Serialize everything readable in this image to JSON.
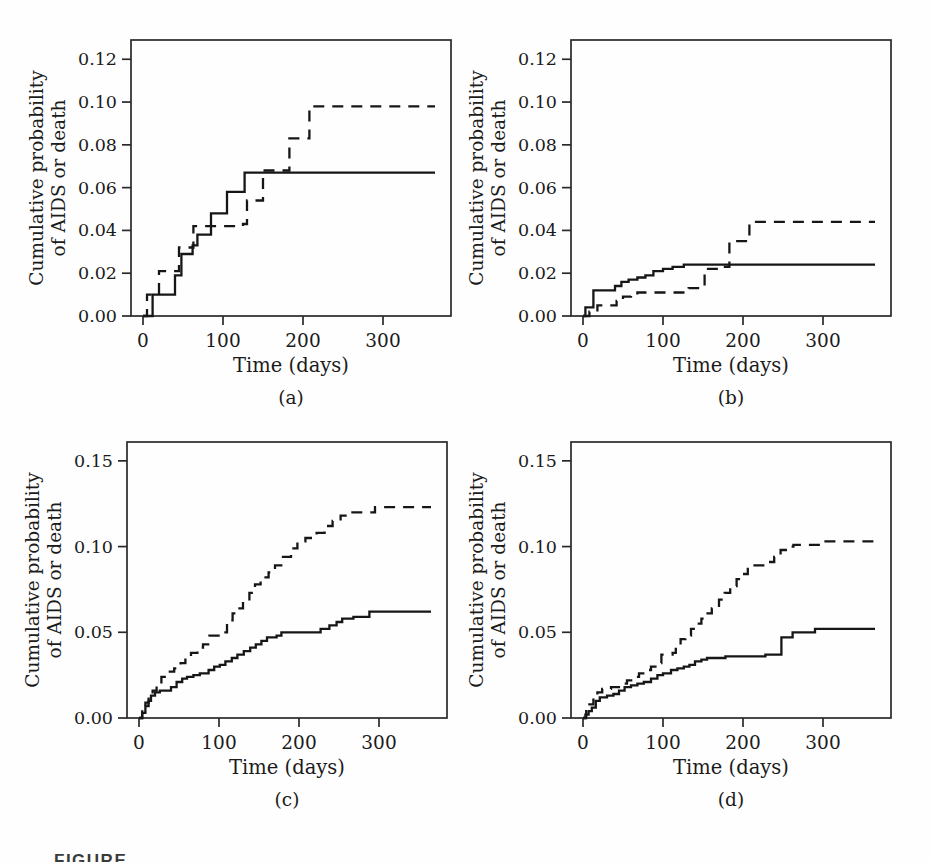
{
  "figure": {
    "bottom_caption_partial": "FIGURE"
  },
  "chart_data": [
    {
      "id": "a",
      "caption": "(a)",
      "type": "line",
      "subtype": "step",
      "xlabel": "Time (days)",
      "ylabel_lines": [
        "Cumulative probability",
        "of AIDS or death"
      ],
      "xlim": [
        -15,
        385
      ],
      "ylim": [
        0,
        0.129
      ],
      "xticks": [
        0,
        100,
        200,
        300
      ],
      "xtick_labels": [
        "0",
        "100",
        "200",
        "300"
      ],
      "yticks": [
        0,
        0.02,
        0.04,
        0.06,
        0.08,
        0.1,
        0.12
      ],
      "ytick_labels": [
        "0.00",
        "0.02",
        "0.04",
        "0.06",
        "0.08",
        "0.10",
        "0.12"
      ],
      "grid": false,
      "legend": "none",
      "line_color": "#161616",
      "series": [
        {
          "name": "solid",
          "dash": "solid",
          "points": [
            [
              0,
              0
            ],
            [
              12,
              0.01
            ],
            [
              40,
              0.019
            ],
            [
              48,
              0.029
            ],
            [
              62,
              0.033
            ],
            [
              68,
              0.038
            ],
            [
              85,
              0.048
            ],
            [
              105,
              0.058
            ],
            [
              127,
              0.067
            ],
            [
              365,
              0.067
            ]
          ]
        },
        {
          "name": "dashed",
          "dash": "dashed",
          "points": [
            [
              0,
              0
            ],
            [
              5,
              0.01
            ],
            [
              20,
              0.021
            ],
            [
              45,
              0.032
            ],
            [
              63,
              0.042
            ],
            [
              125,
              0.043
            ],
            [
              130,
              0.054
            ],
            [
              150,
              0.068
            ],
            [
              183,
              0.083
            ],
            [
              208,
              0.098
            ],
            [
              365,
              0.098
            ]
          ]
        }
      ]
    },
    {
      "id": "b",
      "caption": "(b)",
      "type": "line",
      "subtype": "step",
      "xlabel": "Time (days)",
      "ylabel_lines": [
        "Cumulative probability",
        "of AIDS or death"
      ],
      "xlim": [
        -15,
        385
      ],
      "ylim": [
        0,
        0.129
      ],
      "xticks": [
        0,
        100,
        200,
        300
      ],
      "xtick_labels": [
        "0",
        "100",
        "200",
        "300"
      ],
      "yticks": [
        0,
        0.02,
        0.04,
        0.06,
        0.08,
        0.1,
        0.12
      ],
      "ytick_labels": [
        "0.00",
        "0.02",
        "0.04",
        "0.06",
        "0.08",
        "0.10",
        "0.12"
      ],
      "grid": false,
      "legend": "none",
      "line_color": "#161616",
      "series": [
        {
          "name": "solid",
          "dash": "solid",
          "points": [
            [
              0,
              0
            ],
            [
              3,
              0.004
            ],
            [
              13,
              0.012
            ],
            [
              40,
              0.014
            ],
            [
              48,
              0.016
            ],
            [
              57,
              0.017
            ],
            [
              68,
              0.018
            ],
            [
              78,
              0.019
            ],
            [
              88,
              0.021
            ],
            [
              100,
              0.022
            ],
            [
              112,
              0.023
            ],
            [
              126,
              0.024
            ],
            [
              365,
              0.024
            ]
          ]
        },
        {
          "name": "dashed",
          "dash": "dashed",
          "points": [
            [
              0,
              0
            ],
            [
              8,
              0.002
            ],
            [
              18,
              0.005
            ],
            [
              42,
              0.007
            ],
            [
              50,
              0.009
            ],
            [
              60,
              0.01
            ],
            [
              68,
              0.011
            ],
            [
              132,
              0.013
            ],
            [
              152,
              0.022
            ],
            [
              176,
              0.023
            ],
            [
              183,
              0.035
            ],
            [
              208,
              0.044
            ],
            [
              365,
              0.044
            ]
          ]
        }
      ]
    },
    {
      "id": "c",
      "caption": "(c)",
      "type": "line",
      "subtype": "step",
      "xlabel": "Time (days)",
      "ylabel_lines": [
        "Cumulative probability",
        "of AIDS or death"
      ],
      "xlim": [
        -15,
        385
      ],
      "ylim": [
        0,
        0.161
      ],
      "xticks": [
        0,
        100,
        200,
        300
      ],
      "xtick_labels": [
        "0",
        "100",
        "200",
        "300"
      ],
      "yticks": [
        0,
        0.05,
        0.1,
        0.15
      ],
      "ytick_labels": [
        "0.00",
        "0.05",
        "0.10",
        "0.15"
      ],
      "grid": false,
      "legend": "none",
      "line_color": "#161616",
      "series": [
        {
          "name": "solid",
          "dash": "solid",
          "points": [
            [
              0,
              0
            ],
            [
              4,
              0.003
            ],
            [
              8,
              0.007
            ],
            [
              12,
              0.01
            ],
            [
              15,
              0.013
            ],
            [
              20,
              0.015
            ],
            [
              26,
              0.016
            ],
            [
              40,
              0.018
            ],
            [
              47,
              0.021
            ],
            [
              54,
              0.023
            ],
            [
              60,
              0.024
            ],
            [
              68,
              0.025
            ],
            [
              76,
              0.026
            ],
            [
              87,
              0.028
            ],
            [
              94,
              0.03
            ],
            [
              101,
              0.031
            ],
            [
              108,
              0.033
            ],
            [
              116,
              0.035
            ],
            [
              123,
              0.037
            ],
            [
              131,
              0.039
            ],
            [
              139,
              0.041
            ],
            [
              146,
              0.043
            ],
            [
              153,
              0.045
            ],
            [
              160,
              0.047
            ],
            [
              172,
              0.048
            ],
            [
              178,
              0.05
            ],
            [
              227,
              0.052
            ],
            [
              238,
              0.054
            ],
            [
              247,
              0.056
            ],
            [
              254,
              0.058
            ],
            [
              268,
              0.059
            ],
            [
              288,
              0.062
            ],
            [
              365,
              0.062
            ]
          ]
        },
        {
          "name": "dashed",
          "dash": "dashed",
          "points": [
            [
              0,
              0
            ],
            [
              4,
              0.005
            ],
            [
              8,
              0.009
            ],
            [
              12,
              0.013
            ],
            [
              17,
              0.016
            ],
            [
              22,
              0.02
            ],
            [
              28,
              0.024
            ],
            [
              34,
              0.027
            ],
            [
              44,
              0.029
            ],
            [
              52,
              0.032
            ],
            [
              58,
              0.035
            ],
            [
              65,
              0.038
            ],
            [
              73,
              0.041
            ],
            [
              80,
              0.043
            ],
            [
              88,
              0.048
            ],
            [
              105,
              0.05
            ],
            [
              110,
              0.057
            ],
            [
              117,
              0.061
            ],
            [
              124,
              0.064
            ],
            [
              130,
              0.068
            ],
            [
              138,
              0.073
            ],
            [
              145,
              0.078
            ],
            [
              152,
              0.082
            ],
            [
              162,
              0.085
            ],
            [
              170,
              0.089
            ],
            [
              180,
              0.094
            ],
            [
              190,
              0.099
            ],
            [
              198,
              0.103
            ],
            [
              208,
              0.105
            ],
            [
              222,
              0.108
            ],
            [
              232,
              0.112
            ],
            [
              242,
              0.115
            ],
            [
              252,
              0.118
            ],
            [
              262,
              0.12
            ],
            [
              295,
              0.123
            ],
            [
              365,
              0.123
            ]
          ]
        }
      ]
    },
    {
      "id": "d",
      "caption": "(d)",
      "type": "line",
      "subtype": "step",
      "xlabel": "Time (days)",
      "ylabel_lines": [
        "Cumulative probability",
        "of AIDS or death"
      ],
      "xlim": [
        -15,
        385
      ],
      "ylim": [
        0,
        0.161
      ],
      "xticks": [
        0,
        100,
        200,
        300
      ],
      "xtick_labels": [
        "0",
        "100",
        "200",
        "300"
      ],
      "yticks": [
        0,
        0.05,
        0.1,
        0.15
      ],
      "ytick_labels": [
        "0.00",
        "0.05",
        "0.10",
        "0.15"
      ],
      "grid": false,
      "legend": "none",
      "line_color": "#161616",
      "series": [
        {
          "name": "solid",
          "dash": "solid",
          "points": [
            [
              0,
              0
            ],
            [
              3,
              0.002
            ],
            [
              7,
              0.004
            ],
            [
              11,
              0.006
            ],
            [
              16,
              0.01
            ],
            [
              21,
              0.012
            ],
            [
              30,
              0.013
            ],
            [
              38,
              0.014
            ],
            [
              45,
              0.016
            ],
            [
              52,
              0.018
            ],
            [
              60,
              0.019
            ],
            [
              68,
              0.02
            ],
            [
              76,
              0.021
            ],
            [
              85,
              0.023
            ],
            [
              93,
              0.025
            ],
            [
              100,
              0.026
            ],
            [
              110,
              0.028
            ],
            [
              118,
              0.029
            ],
            [
              126,
              0.03
            ],
            [
              133,
              0.031
            ],
            [
              140,
              0.033
            ],
            [
              148,
              0.034
            ],
            [
              155,
              0.035
            ],
            [
              178,
              0.036
            ],
            [
              228,
              0.037
            ],
            [
              248,
              0.047
            ],
            [
              262,
              0.05
            ],
            [
              290,
              0.052
            ],
            [
              365,
              0.052
            ]
          ]
        },
        {
          "name": "dashed",
          "dash": "dashed",
          "points": [
            [
              0,
              0
            ],
            [
              4,
              0.004
            ],
            [
              8,
              0.008
            ],
            [
              13,
              0.012
            ],
            [
              18,
              0.015
            ],
            [
              24,
              0.017
            ],
            [
              35,
              0.018
            ],
            [
              48,
              0.02
            ],
            [
              55,
              0.022
            ],
            [
              62,
              0.024
            ],
            [
              70,
              0.026
            ],
            [
              78,
              0.028
            ],
            [
              85,
              0.03
            ],
            [
              92,
              0.032
            ],
            [
              98,
              0.037
            ],
            [
              112,
              0.038
            ],
            [
              116,
              0.042
            ],
            [
              122,
              0.046
            ],
            [
              128,
              0.048
            ],
            [
              135,
              0.052
            ],
            [
              141,
              0.055
            ],
            [
              148,
              0.058
            ],
            [
              154,
              0.061
            ],
            [
              161,
              0.064
            ],
            [
              170,
              0.069
            ],
            [
              177,
              0.073
            ],
            [
              184,
              0.077
            ],
            [
              192,
              0.081
            ],
            [
              199,
              0.084
            ],
            [
              206,
              0.087
            ],
            [
              213,
              0.089
            ],
            [
              232,
              0.091
            ],
            [
              239,
              0.094
            ],
            [
              247,
              0.098
            ],
            [
              255,
              0.1
            ],
            [
              263,
              0.101
            ],
            [
              300,
              0.103
            ],
            [
              365,
              0.103
            ]
          ]
        }
      ]
    }
  ]
}
